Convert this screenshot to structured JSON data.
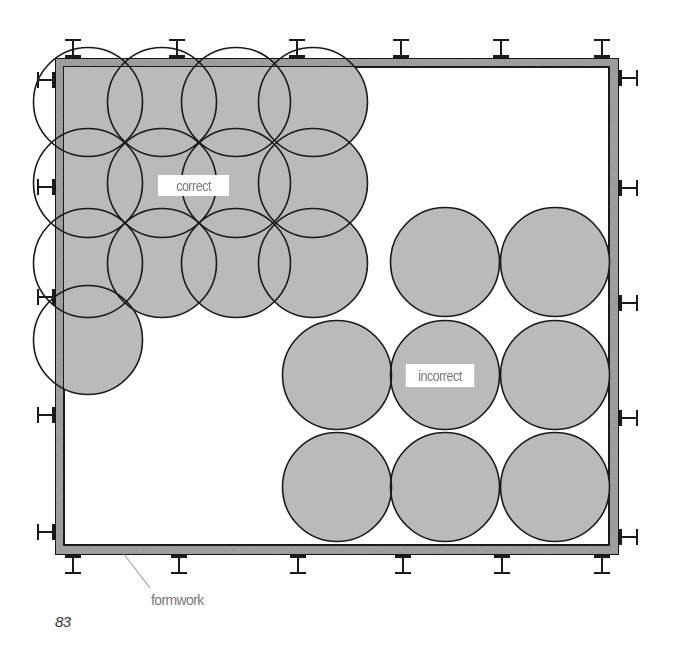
{
  "figure": {
    "number": "83",
    "colors": {
      "concrete_fill": "#bdbdbd",
      "formwork_fill": "#9a9a9a",
      "outline": "#1a1a1a",
      "label_text": "#7a7a7a",
      "background": "#ffffff"
    }
  },
  "formwork": {
    "label": "formwork",
    "outer": {
      "x": 55,
      "y": 58,
      "width": 564,
      "height": 497
    },
    "inner": {
      "x": 64,
      "y": 67,
      "width": 545,
      "height": 478
    },
    "leader": {
      "x1": 123,
      "y1": 553,
      "x2": 150,
      "y2": 588
    },
    "braces_top_x": [
      73,
      177,
      297,
      401,
      501,
      602
    ],
    "braces_bottom_x": [
      73,
      179,
      298,
      403,
      502,
      602
    ],
    "braces_left_y": [
      80,
      187,
      297,
      415,
      532
    ],
    "braces_right_y": [
      78,
      188,
      303,
      418,
      537
    ]
  },
  "correct_pattern": {
    "label": "correct",
    "radius": 54.5,
    "circles": [
      {
        "cx": 88,
        "cy": 102
      },
      {
        "cx": 162,
        "cy": 102
      },
      {
        "cx": 236,
        "cy": 102
      },
      {
        "cx": 313,
        "cy": 102
      },
      {
        "cx": 88,
        "cy": 183
      },
      {
        "cx": 162,
        "cy": 183
      },
      {
        "cx": 236,
        "cy": 183
      },
      {
        "cx": 313,
        "cy": 183
      },
      {
        "cx": 88,
        "cy": 263
      },
      {
        "cx": 162,
        "cy": 263
      },
      {
        "cx": 236,
        "cy": 263
      },
      {
        "cx": 313,
        "cy": 263
      },
      {
        "cx": 88,
        "cy": 340
      }
    ],
    "label_box": {
      "x": 154,
      "y": 175,
      "width": 79,
      "height": 21
    }
  },
  "incorrect_pattern": {
    "label": "incorrect",
    "radius": 54.5,
    "circles": [
      {
        "cx": 445,
        "cy": 262
      },
      {
        "cx": 555,
        "cy": 262
      },
      {
        "cx": 337,
        "cy": 375
      },
      {
        "cx": 445,
        "cy": 375
      },
      {
        "cx": 555,
        "cy": 375
      },
      {
        "cx": 337,
        "cy": 487
      },
      {
        "cx": 445,
        "cy": 487
      },
      {
        "cx": 555,
        "cy": 487
      }
    ],
    "label_box": {
      "x": 402,
      "y": 364,
      "width": 76,
      "height": 23
    }
  }
}
